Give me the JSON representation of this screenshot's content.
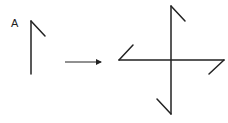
{
  "diagram": {
    "label": "A",
    "colors": {
      "stroke": "#222222",
      "background": "#ffffff"
    },
    "source_shape": {
      "name": "A",
      "stem": {
        "x1": 31,
        "y1": 21,
        "x2": 31,
        "y2": 74
      },
      "flag": {
        "x1": 31,
        "y1": 21,
        "x2": 45,
        "y2": 36
      }
    },
    "arrow": {
      "x1": 65,
      "y1": 62,
      "x2": 103,
      "y2": 62
    },
    "result_shape": {
      "description": "Shape A rotated four times by 90 degrees",
      "vertical": {
        "x1": 171,
        "y1": 6,
        "x2": 171,
        "y2": 114
      },
      "horizontal": {
        "x1": 119,
        "y1": 60,
        "x2": 224,
        "y2": 60
      },
      "flags": [
        {
          "name": "top",
          "x1": 171,
          "y1": 6,
          "x2": 185,
          "y2": 21
        },
        {
          "name": "left",
          "x1": 119,
          "y1": 60,
          "x2": 133,
          "y2": 45
        },
        {
          "name": "right",
          "x1": 224,
          "y1": 60,
          "x2": 209,
          "y2": 74
        },
        {
          "name": "bottom",
          "x1": 171,
          "y1": 114,
          "x2": 157,
          "y2": 99
        }
      ]
    }
  }
}
